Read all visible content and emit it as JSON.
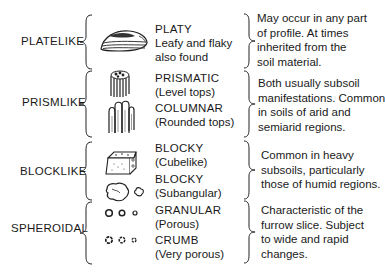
{
  "categories": [
    {
      "label": "PLATELIKE",
      "types": [
        {
          "name": "PLATY",
          "sub": [
            "Leafy and flaky",
            "also found"
          ],
          "icon": "platy-icon"
        }
      ],
      "description": [
        "May occur in any part",
        "of profile. At times",
        "inherited from the",
        "soil material."
      ]
    },
    {
      "label": "PRISMLIKE",
      "types": [
        {
          "name": "PRISMATIC",
          "sub": [
            "(Level tops)"
          ],
          "icon": "prismatic-icon"
        },
        {
          "name": "COLUMNAR",
          "sub": [
            "(Rounded tops)"
          ],
          "icon": "columnar-icon"
        }
      ],
      "description": [
        "Both usually subsoil",
        "manifestations. Common",
        "in soils of arid and",
        "semiarid regions."
      ]
    },
    {
      "label": "BLOCKLIKE",
      "types": [
        {
          "name": "BLOCKY",
          "sub": [
            "(Cubelike)"
          ],
          "icon": "blocky-cubelike-icon"
        },
        {
          "name": "BLOCKY",
          "sub": [
            "(Subangular)"
          ],
          "icon": "blocky-subangular-icon"
        }
      ],
      "description": [
        "Common in heavy",
        "subsoils, particularly",
        "those of humid regions."
      ]
    },
    {
      "label": "SPHEROIDAL",
      "types": [
        {
          "name": "GRANULAR",
          "sub": [
            "(Porous)"
          ],
          "icon": "granular-icon"
        },
        {
          "name": "CRUMB",
          "sub": [
            "(Very porous)"
          ],
          "icon": "crumb-icon"
        }
      ],
      "description": [
        "Characteristic of the",
        "furrow slice. Subject",
        "to wide and rapid",
        "changes."
      ]
    }
  ]
}
